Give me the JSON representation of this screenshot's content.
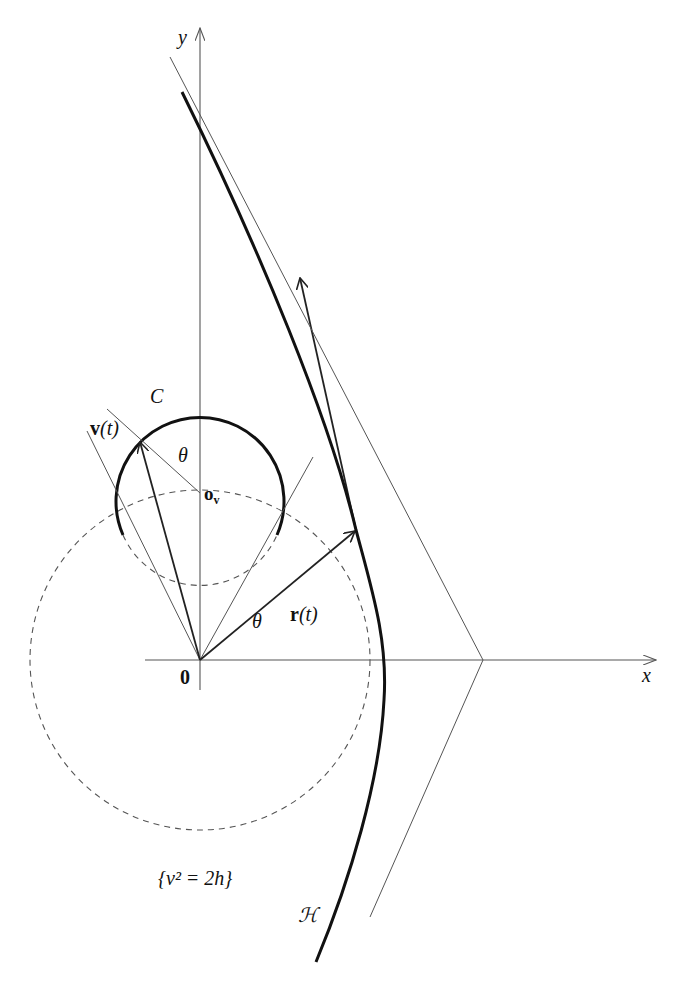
{
  "figure": {
    "labels": {
      "x_axis": "x",
      "y_axis": "y",
      "origin": "0",
      "circle": "C",
      "velocity": "v",
      "velocity_arg": "(t)",
      "position": "r",
      "position_arg": "(t)",
      "theta_upper": "θ",
      "theta_lower": "θ",
      "center": "o",
      "center_sub": "v",
      "energy_set": "{v² = 2h}",
      "hyperbola": "ℋ"
    },
    "colors": {
      "curve": "#111111",
      "thin_line": "#555555",
      "background": "#ffffff"
    }
  }
}
